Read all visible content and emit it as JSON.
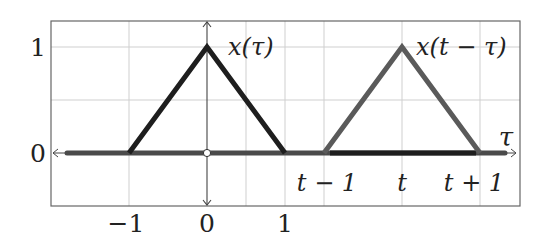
{
  "diagram": {
    "title": "",
    "colors": {
      "grid": "#c8c8c8",
      "frame": "#555555",
      "axis": "#444444",
      "x_tau": "#1e1e1e",
      "x_t_minus_tau": "#5a5a5a",
      "baseline": "#4a4a4a"
    },
    "y_ticks": [
      {
        "label": "1",
        "value": 1
      },
      {
        "label": "0",
        "value": 0
      }
    ],
    "x_ticks_bottom": [
      {
        "label": "−1",
        "value": -1
      },
      {
        "label": "0",
        "value": 0
      },
      {
        "label": "1",
        "value": 1
      }
    ],
    "x_ticks_inner": [
      {
        "label": "t − 1"
      },
      {
        "label": "t"
      },
      {
        "label": "t + 1"
      }
    ],
    "axis_label_x": "τ",
    "curves": [
      {
        "name": "x(τ)",
        "label": "x(τ)",
        "points": [
          [
            -1,
            0
          ],
          [
            0,
            1
          ],
          [
            1,
            0
          ]
        ]
      },
      {
        "name": "x(t−τ)",
        "label": "x(t − τ)",
        "points": [
          [
            "t-1",
            0
          ],
          [
            "t",
            1
          ],
          [
            "t+1",
            0
          ]
        ]
      }
    ]
  }
}
